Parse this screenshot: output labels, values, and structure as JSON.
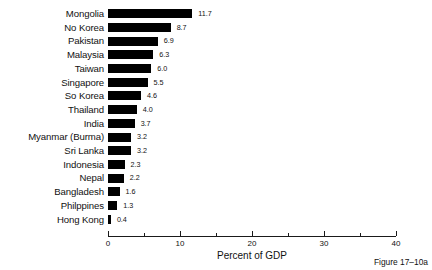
{
  "chart_data": {
    "type": "bar",
    "orientation": "horizontal",
    "title": "",
    "xlabel": "Percent of GDP",
    "ylabel": "",
    "xlim": [
      0,
      40
    ],
    "xticks": [
      0,
      10,
      20,
      30,
      40
    ],
    "xtick_labels": [
      "0",
      "10",
      "20",
      "30",
      "40"
    ],
    "minor_xticks": [
      5,
      15,
      25,
      35
    ],
    "grid": false,
    "legend": null,
    "bar_color": "#000000",
    "categories": [
      "Mongolia",
      "No Korea",
      "Pakistan",
      "Malaysia",
      "Taiwan",
      "Singapore",
      "So Korea",
      "Thailand",
      "India",
      "Myanmar (Burma)",
      "Sri Lanka",
      "Indonesia",
      "Nepal",
      "Bangladesh",
      "Philppines",
      "Hong Kong"
    ],
    "values": [
      11.7,
      8.7,
      6.9,
      6.3,
      6.0,
      5.5,
      4.6,
      4.0,
      3.7,
      3.2,
      3.2,
      2.3,
      2.2,
      1.6,
      1.3,
      0.4
    ],
    "value_labels": [
      "11.7",
      "8.7",
      "6.9",
      "6.3",
      "6.0",
      "5.5",
      "4.6",
      "4.0",
      "3.7",
      "3.2",
      "3.2",
      "2.3",
      "2.2",
      "1.6",
      "1.3",
      "0.4"
    ]
  },
  "caption": {
    "figure_number": "Figure 17–10a"
  }
}
